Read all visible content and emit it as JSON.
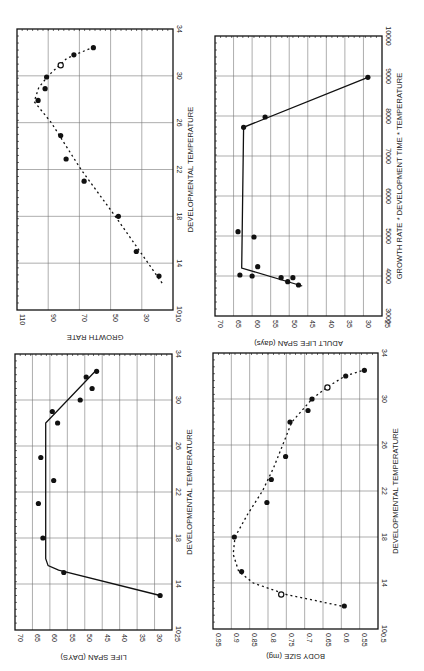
{
  "figure": {
    "orientation": "rotated 90 degrees counter-clockwise",
    "panels": [
      "growth_rate",
      "adult_life_span",
      "life_span",
      "body_size"
    ]
  },
  "chart_data": [
    {
      "id": "growth_rate",
      "type": "scatter",
      "title": "",
      "xlabel": "DEVELOPMENTAL TEMPERATURE",
      "ylabel": "GROWTH RATE",
      "xlim": [
        10,
        34
      ],
      "ylim": [
        10,
        110
      ],
      "xticks": [
        "10",
        "14",
        "18",
        "22",
        "26",
        "30",
        "34"
      ],
      "yticks": [
        "10",
        "30",
        "50",
        "70",
        "90",
        "110"
      ],
      "grid": true,
      "fit_style": "dashed",
      "points": [
        {
          "x": 12.9,
          "y": 19
        },
        {
          "x": 15.0,
          "y": 33.5
        },
        {
          "x": 18.0,
          "y": 45
        },
        {
          "x": 21.0,
          "y": 67
        },
        {
          "x": 22.9,
          "y": 78.5
        },
        {
          "x": 24.9,
          "y": 82
        },
        {
          "x": 27.9,
          "y": 96.5
        },
        {
          "x": 28.9,
          "y": 92
        },
        {
          "x": 29.9,
          "y": 91
        },
        {
          "x": 30.9,
          "y": 82,
          "hollow": true
        },
        {
          "x": 31.8,
          "y": 73.5
        },
        {
          "x": 32.4,
          "y": 61
        }
      ],
      "fit": [
        {
          "x": 12.3,
          "y": 17
        },
        {
          "x": 18.0,
          "y": 47
        },
        {
          "x": 22.0,
          "y": 69
        },
        {
          "x": 26.0,
          "y": 88
        },
        {
          "x": 27.8,
          "y": 99
        },
        {
          "x": 29.0,
          "y": 96
        },
        {
          "x": 30.0,
          "y": 90
        },
        {
          "x": 31.5,
          "y": 78
        },
        {
          "x": 32.4,
          "y": 62
        }
      ]
    },
    {
      "id": "adult_life_span",
      "type": "scatter",
      "title": "",
      "xlabel": "GROWTH RATE * DEVELOPMENT TIME * TEMPERATURE",
      "ylabel": "ADULT LIFE SPAN (days)",
      "xlim": [
        3000,
        10000
      ],
      "ylim": [
        25,
        70
      ],
      "xticks": [
        "3000",
        "4000",
        "5000",
        "6000",
        "7000",
        "8000",
        "9000",
        "10000"
      ],
      "yticks": [
        "25",
        "30",
        "35",
        "40",
        "45",
        "50",
        "55",
        "60",
        "65",
        "70"
      ],
      "grid": true,
      "fit_style": "solid",
      "points": [
        {
          "x": 3775,
          "y": 47.5
        },
        {
          "x": 3858,
          "y": 50.4
        },
        {
          "x": 3958,
          "y": 49
        },
        {
          "x": 3958,
          "y": 52.2
        },
        {
          "x": 4000,
          "y": 60
        },
        {
          "x": 4025,
          "y": 63.3
        },
        {
          "x": 4233,
          "y": 58.5
        },
        {
          "x": 4975,
          "y": 59.5
        },
        {
          "x": 5108,
          "y": 63.8
        },
        {
          "x": 7717,
          "y": 62.3
        },
        {
          "x": 7975,
          "y": 56.5
        },
        {
          "x": 8967,
          "y": 28.8
        }
      ],
      "fit": [
        {
          "x": 3750,
          "y": 46.5
        },
        {
          "x": 4200,
          "y": 62.8
        },
        {
          "x": 7717,
          "y": 62.3
        },
        {
          "x": 8967,
          "y": 28.8
        }
      ]
    },
    {
      "id": "life_span",
      "type": "scatter",
      "title": "",
      "xlabel": "DEVELOPMENTAL TEMPERATURE",
      "ylabel": "LIFE SPAN (DAYS)",
      "xlim": [
        10,
        34
      ],
      "ylim": [
        25,
        70
      ],
      "xticks": [
        "10",
        "14",
        "18",
        "22",
        "26",
        "30",
        "34"
      ],
      "yticks": [
        "25",
        "30",
        "35",
        "40",
        "45",
        "50",
        "55",
        "60",
        "65",
        "70"
      ],
      "grid": true,
      "fit_style": "solid",
      "points": [
        {
          "x": 13.0,
          "y": 28.4
        },
        {
          "x": 15.0,
          "y": 56
        },
        {
          "x": 18.0,
          "y": 62
        },
        {
          "x": 21.0,
          "y": 63.3
        },
        {
          "x": 23.0,
          "y": 58.9
        },
        {
          "x": 25.0,
          "y": 62.6
        },
        {
          "x": 28.0,
          "y": 57.8
        },
        {
          "x": 29.0,
          "y": 59.3
        },
        {
          "x": 30.0,
          "y": 51.3
        },
        {
          "x": 31.0,
          "y": 47.9
        },
        {
          "x": 32.0,
          "y": 49.6
        },
        {
          "x": 32.5,
          "y": 46.6
        }
      ],
      "fit": [
        {
          "x": 13.0,
          "y": 28.4
        },
        {
          "x": 15.2,
          "y": 57.5
        },
        {
          "x": 15.6,
          "y": 60.5
        },
        {
          "x": 16.2,
          "y": 61.2
        },
        {
          "x": 28.0,
          "y": 61.2
        },
        {
          "x": 32.5,
          "y": 47
        }
      ]
    },
    {
      "id": "body_size",
      "type": "scatter",
      "title": "",
      "xlabel": "DEVELOPMENTAL TEMPERATURE",
      "ylabel": "BODY SIZE (mg)",
      "xlim": [
        10,
        34
      ],
      "ylim": [
        0.5,
        0.95
      ],
      "xticks": [
        "10",
        "14",
        "18",
        "22",
        "26",
        "30",
        "34"
      ],
      "yticks": [
        "0.5",
        "0.55",
        "0.6",
        "0.65",
        "0.7",
        "0.75",
        "0.8",
        "0.85",
        "0.9",
        "0.95"
      ],
      "grid": true,
      "fit_style": "dashed",
      "points": [
        {
          "x": 12.0,
          "y": 0.592
        },
        {
          "x": 13.0,
          "y": 0.764,
          "hollow": true
        },
        {
          "x": 15.0,
          "y": 0.872
        },
        {
          "x": 18.0,
          "y": 0.892
        },
        {
          "x": 21.0,
          "y": 0.803
        },
        {
          "x": 23.0,
          "y": 0.791
        },
        {
          "x": 25.0,
          "y": 0.752
        },
        {
          "x": 28.0,
          "y": 0.74
        },
        {
          "x": 29.0,
          "y": 0.691
        },
        {
          "x": 30.0,
          "y": 0.68
        },
        {
          "x": 31.0,
          "y": 0.638,
          "hollow": true
        },
        {
          "x": 32.0,
          "y": 0.588
        },
        {
          "x": 32.5,
          "y": 0.537
        }
      ],
      "fit": [
        {
          "x": 12.0,
          "y": 0.6
        },
        {
          "x": 13.0,
          "y": 0.75
        },
        {
          "x": 14.0,
          "y": 0.84
        },
        {
          "x": 15.0,
          "y": 0.88
        },
        {
          "x": 16.5,
          "y": 0.895
        },
        {
          "x": 18.0,
          "y": 0.89
        },
        {
          "x": 20.0,
          "y": 0.855
        },
        {
          "x": 22.0,
          "y": 0.815
        },
        {
          "x": 24.0,
          "y": 0.785
        },
        {
          "x": 26.0,
          "y": 0.76
        },
        {
          "x": 28.0,
          "y": 0.735
        },
        {
          "x": 30.0,
          "y": 0.68
        },
        {
          "x": 31.0,
          "y": 0.64
        },
        {
          "x": 32.0,
          "y": 0.59
        },
        {
          "x": 32.5,
          "y": 0.54
        }
      ]
    }
  ]
}
